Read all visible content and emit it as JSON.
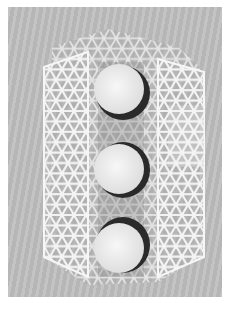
{
  "image": {
    "subject": "hexagonal kagome-lattice mesh cylinder with three stacked white disks",
    "colors": {
      "border": "#ffffff",
      "background": "#bdbdbd",
      "mesh": "#f4f4f4",
      "disk_face": "#eeeeee",
      "disk_rim": "#2a2a2a",
      "shadow": "#9a9a9a"
    },
    "disks": [
      {
        "cx": 112,
        "cy": 83,
        "r": 26
      },
      {
        "cx": 112,
        "cy": 161,
        "r": 26
      },
      {
        "cx": 112,
        "cy": 240,
        "r": 26
      }
    ]
  }
}
